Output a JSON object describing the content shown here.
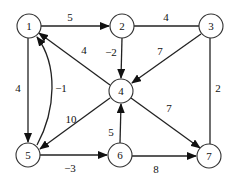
{
  "graph": {
    "nodes": [
      {
        "id": "1",
        "label": "1",
        "x": 29,
        "y": 26
      },
      {
        "id": "2",
        "label": "2",
        "x": 122,
        "y": 26
      },
      {
        "id": "3",
        "label": "3",
        "x": 211,
        "y": 26
      },
      {
        "id": "4",
        "label": "4",
        "x": 121,
        "y": 91
      },
      {
        "id": "5",
        "label": "5",
        "x": 28,
        "y": 155
      },
      {
        "id": "6",
        "label": "6",
        "x": 120,
        "y": 155
      },
      {
        "id": "7",
        "label": "7",
        "x": 209,
        "y": 156
      }
    ],
    "edges": [
      {
        "from": "1",
        "to": "2",
        "weight": "5",
        "directed": true
      },
      {
        "from": "2",
        "to": "3",
        "weight": "4",
        "directed": false
      },
      {
        "from": "2",
        "to": "4",
        "weight": "-2",
        "directed": true
      },
      {
        "from": "3",
        "to": "4",
        "weight": "7",
        "directed": true
      },
      {
        "from": "3",
        "to": "7",
        "weight": "2",
        "directed": false
      },
      {
        "from": "4",
        "to": "1",
        "weight": "4",
        "directed": true
      },
      {
        "from": "1",
        "to": "5",
        "weight": "4",
        "directed": true
      },
      {
        "from": "5",
        "to": "1",
        "weight": "-1",
        "directed": true,
        "curved": true
      },
      {
        "from": "4",
        "to": "5",
        "weight": "10",
        "directed": true
      },
      {
        "from": "4",
        "to": "7",
        "weight": "7",
        "directed": true
      },
      {
        "from": "6",
        "to": "4",
        "weight": "5",
        "directed": true
      },
      {
        "from": "5",
        "to": "6",
        "weight": "-3",
        "directed": true
      },
      {
        "from": "6",
        "to": "7",
        "weight": "8",
        "directed": true
      }
    ]
  },
  "labels": {
    "n1": "1",
    "n2": "2",
    "n3": "3",
    "n4": "4",
    "n5": "5",
    "n6": "6",
    "n7": "7",
    "e12": "5",
    "e23": "4",
    "e24": "−2",
    "e34": "7",
    "e37": "2",
    "e41": "4",
    "e15": "4",
    "e51": "−1",
    "e45": "10",
    "e47": "7",
    "e64": "5",
    "e56": "−3",
    "e67": "8"
  }
}
